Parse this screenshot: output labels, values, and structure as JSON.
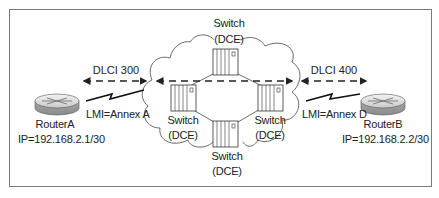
{
  "diagram": {
    "type": "frame-relay-network",
    "frame_color": "#7a7a7a",
    "cloud": {
      "switches": [
        {
          "id": "top",
          "label_line1": "Switch",
          "label_line2": "(DCE)"
        },
        {
          "id": "left",
          "label_line1": "Switch",
          "label_line2": "(DCE)"
        },
        {
          "id": "right",
          "label_line1": "Switch",
          "label_line2": "(DCE)"
        },
        {
          "id": "bottom",
          "label_line1": "Switch",
          "label_line2": "(DCE)"
        }
      ]
    },
    "router_a": {
      "name": "RouterA",
      "ip": "IP=192.168.2.1/30",
      "lmi": "LMI=Annex A",
      "dlci": "DLCI 300"
    },
    "router_b": {
      "name": "RouterB",
      "ip": "IP=192.168.2.2/30",
      "lmi": "LMI=Annex D",
      "dlci": "DLCI 400"
    }
  }
}
